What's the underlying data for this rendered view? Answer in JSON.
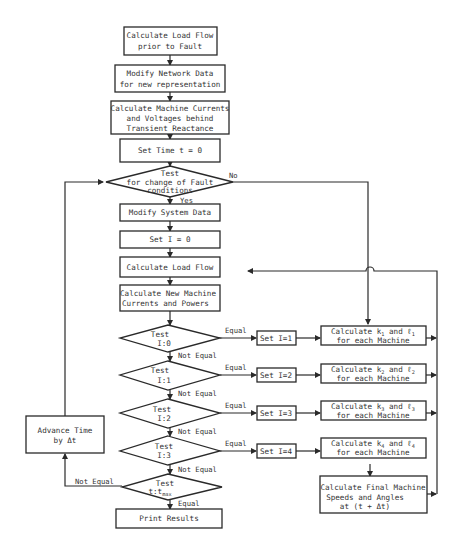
{
  "diagram": {
    "type": "flowchart",
    "colors": {
      "stroke": "#2a2a2a",
      "text": "#333333",
      "background": "#ffffff"
    },
    "boxes": {
      "load_flow_prior": [
        "Calculate Load Flow",
        "prior to Fault"
      ],
      "modify_network": [
        "Modify Network Data",
        "for new representation"
      ],
      "machine_currents": [
        "Calculate Machine Currents",
        "and Voltages behind",
        "Transient Reactance"
      ],
      "set_time": [
        "Set Time t = 0"
      ],
      "modify_system": [
        "Modify System Data"
      ],
      "set_i0": [
        "Set I = 0"
      ],
      "load_flow": [
        "Calculate Load Flow"
      ],
      "new_machine": [
        "Calculate New Machine",
        "Currents and Powers"
      ],
      "set_i1": [
        "Set I=1"
      ],
      "set_i2": [
        "Set I=2"
      ],
      "set_i3": [
        "Set I=3"
      ],
      "set_i4": [
        "Set I=4"
      ],
      "calc_k1": [
        "Calculate k",
        "1",
        " and ℓ",
        "1",
        "for each Machine"
      ],
      "calc_k2": [
        "Calculate k",
        "2",
        " and ℓ",
        "2",
        "for each Machine"
      ],
      "calc_k3": [
        "Calculate k",
        "3",
        " and ℓ",
        "3",
        "for each Machine"
      ],
      "calc_k4": [
        "Calculate k",
        "4",
        " and ℓ",
        "4",
        "for each Machine"
      ],
      "final_speeds": [
        "Calculate Final Machine",
        "Speeds and Angles",
        "at (t + Δt)"
      ],
      "advance_time": [
        "Advance Time",
        "by Δt"
      ],
      "print_results": [
        "Print Results"
      ]
    },
    "decisions": {
      "fault_change": [
        "Test",
        "for change of Fault",
        "conditions"
      ],
      "test_i0": [
        "Test",
        "I:0"
      ],
      "test_i1": [
        "Test",
        "I:1"
      ],
      "test_i2": [
        "Test",
        "I:2"
      ],
      "test_i3": [
        "Test",
        "I:3"
      ],
      "test_tmax": [
        "Test",
        "t:t",
        "max"
      ]
    },
    "edge_labels": {
      "no": "No",
      "yes": "Yes",
      "equal": "Equal",
      "not_equal": "Not Equal"
    }
  }
}
